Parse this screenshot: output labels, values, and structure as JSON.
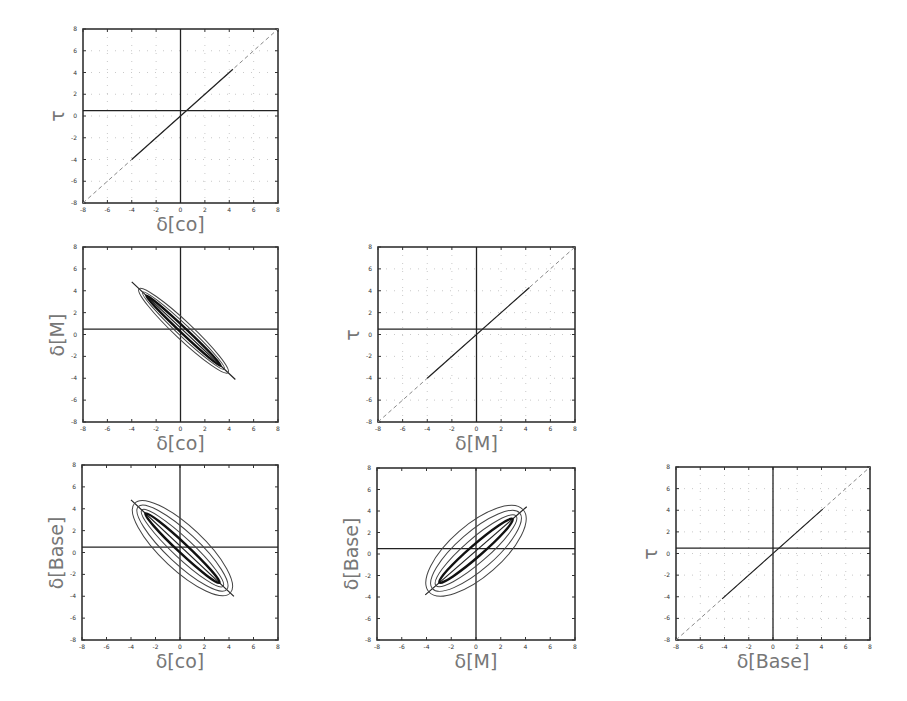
{
  "figure": {
    "layout": "lower-triangular 3x3 corner plot",
    "axis_range": [
      -8,
      8
    ],
    "tick_values": [
      -8,
      -6,
      -4,
      -2,
      0,
      2,
      4,
      6,
      8
    ],
    "tick_labels": [
      "-8",
      "-6",
      "-4",
      "-2",
      "0",
      "2",
      "4",
      "6",
      "8"
    ],
    "reference_lines": {
      "horizontal_y": 0.5,
      "vertical_x": 0
    },
    "colors": {
      "frame": "#333333",
      "grid": "#bbbbbb",
      "curve": "#222222",
      "dashed": "#888888",
      "label": "#777777"
    }
  },
  "chart_data": [
    {
      "id": "p1",
      "type": "line",
      "row": 1,
      "col": 1,
      "xlabel": "δ[co]",
      "ylabel": "τ",
      "xlim": [
        -8,
        8
      ],
      "ylim": [
        -8,
        8
      ],
      "grid": true,
      "frame": [
        83,
        29,
        195,
        174
      ],
      "series": [
        {
          "name": "identity (dashed)",
          "style": "dashed",
          "x": [
            -8,
            8
          ],
          "y": [
            -8,
            8
          ]
        },
        {
          "name": "trace",
          "style": "solid",
          "x": [
            -4,
            4.3
          ],
          "y": [
            -4,
            4.3
          ]
        }
      ]
    },
    {
      "id": "p2",
      "type": "contour",
      "row": 2,
      "col": 1,
      "xlabel": "δ[co]",
      "ylabel": "δ[M]",
      "xlim": [
        -8,
        8
      ],
      "ylim": [
        -8,
        8
      ],
      "grid": false,
      "frame": [
        83,
        247,
        195,
        175
      ],
      "series": [
        {
          "name": "posterior contours",
          "center": [
            0.2,
            0.4
          ],
          "slope": -1.05,
          "extent_x": [
            -4,
            4.5
          ],
          "widths": [
            0.15,
            0.3,
            0.45
          ]
        }
      ]
    },
    {
      "id": "p3",
      "type": "line",
      "row": 2,
      "col": 2,
      "xlabel": "δ[M]",
      "ylabel": "τ",
      "xlim": [
        -8,
        8
      ],
      "ylim": [
        -8,
        8
      ],
      "grid": true,
      "frame": [
        378,
        247,
        197,
        175
      ],
      "series": [
        {
          "name": "identity (dashed)",
          "style": "dashed",
          "x": [
            -8,
            8
          ],
          "y": [
            -8,
            8
          ]
        },
        {
          "name": "trace",
          "style": "solid",
          "x": [
            -4,
            4.3
          ],
          "y": [
            -4,
            4.3
          ]
        }
      ]
    },
    {
      "id": "p4",
      "type": "contour",
      "row": 3,
      "col": 1,
      "xlabel": "δ[co]",
      "ylabel": "δ[Base]",
      "xlim": [
        -8,
        8
      ],
      "ylim": [
        -8,
        8
      ],
      "grid": false,
      "frame": [
        82,
        465,
        196,
        175
      ],
      "series": [
        {
          "name": "posterior contours",
          "center": [
            0.2,
            0.4
          ],
          "slope": -1.05,
          "extent_x": [
            -4,
            4.4
          ],
          "widths": [
            0.25,
            0.5,
            0.8,
            1.1
          ]
        }
      ]
    },
    {
      "id": "p5",
      "type": "contour",
      "row": 3,
      "col": 2,
      "xlabel": "δ[M]",
      "ylabel": "δ[Base]",
      "xlim": [
        -8,
        8
      ],
      "ylim": [
        -8,
        8
      ],
      "grid": false,
      "frame": [
        377,
        468,
        198,
        172
      ],
      "series": [
        {
          "name": "posterior contours",
          "center": [
            0,
            0.3
          ],
          "slope": 1.0,
          "extent_x": [
            -4.1,
            4.1
          ],
          "widths": [
            0.3,
            0.6,
            0.95,
            1.3
          ]
        }
      ]
    },
    {
      "id": "p6",
      "type": "line",
      "row": 3,
      "col": 3,
      "xlabel": "δ[Base]",
      "ylabel": "τ",
      "xlim": [
        -8,
        8
      ],
      "ylim": [
        -8,
        8
      ],
      "grid": true,
      "frame": [
        676,
        467,
        194,
        173
      ],
      "series": [
        {
          "name": "identity (dashed)",
          "style": "dashed",
          "x": [
            -8,
            8
          ],
          "y": [
            -8,
            8
          ]
        },
        {
          "name": "trace",
          "style": "solid",
          "x": [
            -4.2,
            4.1
          ],
          "y": [
            -4.2,
            4.1
          ]
        }
      ]
    }
  ]
}
